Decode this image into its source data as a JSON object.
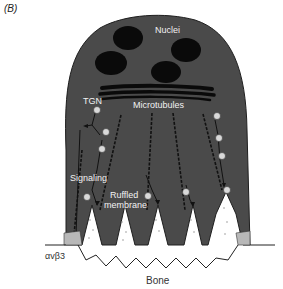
{
  "panel_label": "(B)",
  "labels": {
    "nuclei": "Nuclei",
    "tgn": "TGN",
    "microtubules": "Microtubules",
    "signaling": "Signaling",
    "ruffled_line1": "Ruffled",
    "ruffled_line2": "membrane",
    "integrin": "αvβ3",
    "bone": "Bone"
  },
  "colors": {
    "cell_body": "#4a4a4a",
    "nuclei": "#0a0a0a",
    "background": "#ffffff",
    "integrin_patch": "#b8b8b8",
    "vesicle": "#d9d9d9"
  }
}
